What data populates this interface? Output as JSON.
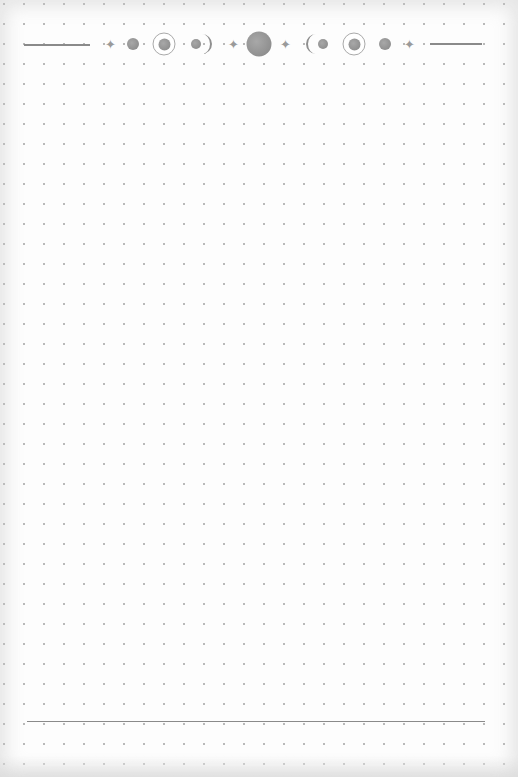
{
  "page": {
    "type": "dot-grid journal page",
    "grid_spacing_px": 20,
    "colors": {
      "paper": "#fdfdfd",
      "dots": "#b9b9b9",
      "ornament": "#8a8a8a"
    }
  },
  "header_ornament": {
    "description": "moon phase border",
    "elements": [
      {
        "name": "left-rule-line"
      },
      {
        "name": "star-icon",
        "glyph": "✦"
      },
      {
        "name": "new-moon-dot-icon"
      },
      {
        "name": "ringed-moon-icon"
      },
      {
        "name": "waxing-crescent-icon"
      },
      {
        "name": "star-icon",
        "glyph": "✦"
      },
      {
        "name": "full-moon-icon"
      },
      {
        "name": "star-icon",
        "glyph": "✦"
      },
      {
        "name": "waning-crescent-icon"
      },
      {
        "name": "ringed-moon-icon"
      },
      {
        "name": "new-moon-dot-icon"
      },
      {
        "name": "star-icon",
        "glyph": "✦"
      },
      {
        "name": "right-rule-line"
      }
    ]
  },
  "footer": {
    "description": "bottom rule line"
  }
}
